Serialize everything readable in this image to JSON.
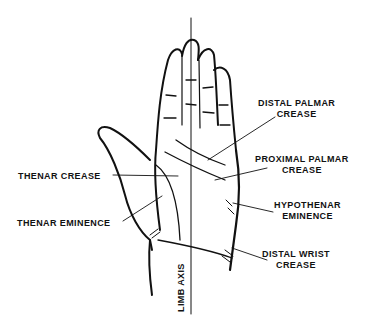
{
  "diagram": {
    "labels": {
      "distal_palmar_crease": [
        "DISTAL  PALMAR",
        "CREASE"
      ],
      "proximal_palmar_crease": [
        "PROXIMAL  PALMAR",
        "CREASE"
      ],
      "thenar_crease": "THENAR  CREASE",
      "thenar_eminence": "THENAR  EMINENCE",
      "hypothenar_eminence": [
        "HYPOTHENAR",
        "EMINENCE"
      ],
      "distal_wrist_crease": [
        "DISTAL  WRIST",
        "CREASE"
      ],
      "limb_axis": "LIMB  AXIS"
    },
    "colors": {
      "ink": "#111111",
      "background": "#ffffff"
    }
  }
}
